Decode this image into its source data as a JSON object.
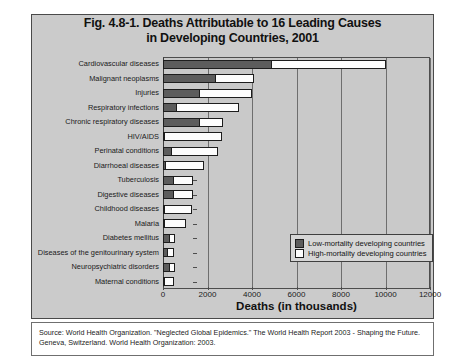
{
  "figure": {
    "title_line1": "Fig. 4.8-1. Deaths Attributable to 16 Leading Causes",
    "title_line2": "in Developing Countries, 2001",
    "source_note": "Source: World Health Organization. \"Neglected Global Epidemics.\" The World Health Report 2003 - Shaping the Future. Geneva, Switzerland. World Health Organization: 2003."
  },
  "legend": {
    "items": [
      {
        "label": "Low-mortality developing countries",
        "color": "#5c5c5c",
        "key": "low"
      },
      {
        "label": "High-mortality developing countries",
        "color": "#fdfdfd",
        "key": "high"
      }
    ]
  },
  "chart_data": {
    "type": "bar",
    "orientation": "horizontal",
    "stacked": true,
    "title": "Fig. 4.8-1. Deaths Attributable to 16 Leading Causes in Developing Countries, 2001",
    "xlabel": "Deaths (in thousands)",
    "ylabel": "",
    "xlim": [
      0,
      12000
    ],
    "xticks": [
      0,
      2000,
      4000,
      6000,
      8000,
      10000,
      12000
    ],
    "grid": true,
    "legend_position": "lower-right",
    "categories": [
      "Cardiovascular diseases",
      "Malignant neoplasms",
      "Injuries",
      "Respiratory infections",
      "Chronic respiratory diseases",
      "HIV/AIDS",
      "Perinatal conditions",
      "Diarrhoeal diseases",
      "Tuberculosis",
      "Digestive diseases",
      "Childhood diseases",
      "Malaria",
      "Diabetes mellitus",
      "Diseases of the genitourinary system",
      "Neuropsychiatric disorders",
      "Maternal conditions"
    ],
    "series": [
      {
        "name": "Low-mortality developing countries",
        "color": "#5c5c5c",
        "values": [
          4900,
          2400,
          1650,
          650,
          1650,
          100,
          400,
          150,
          500,
          500,
          100,
          50,
          300,
          220,
          300,
          50
        ]
      },
      {
        "name": "High-mortality developing countries",
        "color": "#fdfdfd",
        "values": [
          5150,
          1750,
          2400,
          2800,
          1100,
          2600,
          2100,
          1750,
          900,
          900,
          1250,
          1000,
          300,
          300,
          300,
          450
        ]
      }
    ],
    "totals": [
      10050,
      4150,
      4050,
      3450,
      2750,
      2700,
      2500,
      1900,
      1400,
      1400,
      1350,
      1050,
      600,
      520,
      600,
      500
    ]
  }
}
